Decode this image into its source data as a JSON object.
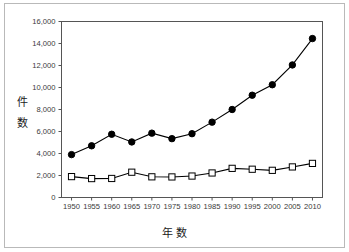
{
  "chart_data": {
    "type": "line",
    "title": "",
    "xlabel": "年 数",
    "ylabel": "件数",
    "x": [
      1950,
      1955,
      1960,
      1965,
      1970,
      1975,
      1980,
      1985,
      1990,
      1995,
      2000,
      2005,
      2010
    ],
    "categories": [
      "1950",
      "1955",
      "1960",
      "1965",
      "1970",
      "1975",
      "1980",
      "1985",
      "1990",
      "1995",
      "2000",
      "2005",
      "2010"
    ],
    "xlim": [
      1947.5,
      2012.5
    ],
    "ylim": [
      0,
      16000
    ],
    "yticks": [
      0,
      2000,
      4000,
      6000,
      8000,
      10000,
      12000,
      14000,
      16000
    ],
    "ytick_labels": [
      "0",
      "2,000",
      "4,000",
      "6,000",
      "8,000",
      "10,000",
      "12,000",
      "14,000",
      "16,000"
    ],
    "grid": false,
    "legend": "none",
    "series": [
      {
        "name": "filled-circle-series",
        "marker": "filled-circle",
        "color": "#000000",
        "values": [
          3900,
          4700,
          5750,
          5050,
          5850,
          5350,
          5800,
          6850,
          8000,
          9300,
          10250,
          12050,
          14450
        ]
      },
      {
        "name": "open-square-series",
        "marker": "open-square",
        "color": "#000000",
        "values": [
          1900,
          1720,
          1730,
          2300,
          1880,
          1870,
          1950,
          2230,
          2650,
          2570,
          2470,
          2780,
          3100
        ]
      }
    ]
  },
  "frame": {
    "border_color": "#b9b9b9",
    "axis_color": "#444444",
    "background": "#ffffff"
  }
}
